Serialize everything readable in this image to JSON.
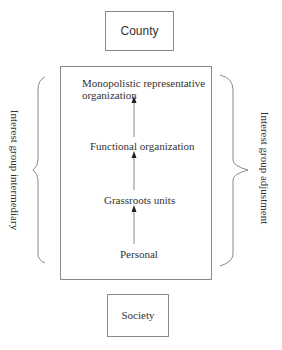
{
  "diagram": {
    "top_box": {
      "label": "County"
    },
    "bottom_box": {
      "label": "Society"
    },
    "hierarchy": [
      {
        "label": "Monopolistic representative",
        "label_line2": "organization"
      },
      {
        "label": "Functional organization"
      },
      {
        "label": "Grassroots units"
      },
      {
        "label": "Personal"
      }
    ],
    "left_brace_label": "Interest group intermediary",
    "right_brace_label": "Interest group adjustment",
    "arrows": [
      {
        "from": "Personal",
        "to": "Grassroots units"
      },
      {
        "from": "Grassroots units",
        "to": "Functional organization"
      },
      {
        "from": "Functional organization",
        "to": "Monopolistic representative organization"
      }
    ],
    "colors": {
      "line": "#8a8a8a",
      "text": "#333333"
    }
  }
}
